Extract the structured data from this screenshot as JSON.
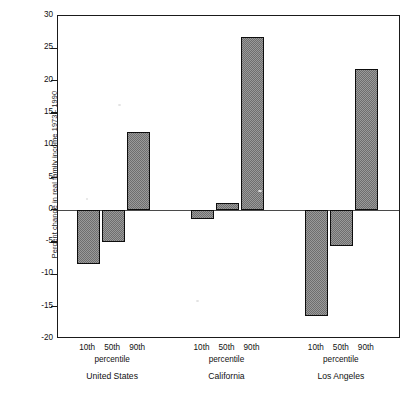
{
  "chart_data": {
    "type": "bar",
    "title": "",
    "xlabel": "",
    "ylabel": "Percent change in real family income 1973 - 1990",
    "ylim": [
      -20,
      30
    ],
    "yticks": [
      30,
      25,
      20,
      15,
      10,
      5,
      0,
      -5,
      -10,
      -15,
      -20
    ],
    "ytick_labels": [
      "30",
      "25",
      "20",
      "15",
      "10",
      "5",
      "0",
      "-5",
      "-10",
      "-15",
      "-20"
    ],
    "grid": false,
    "legend": null,
    "zero_reference_line": true,
    "categories": [
      "10th",
      "50th",
      "90th"
    ],
    "category_axis_label": "percentile",
    "groups": [
      {
        "name": "United States",
        "sub_label": "percentile",
        "bars": [
          {
            "category": "10th",
            "value": -8.4
          },
          {
            "category": "50th",
            "value": -5.0
          },
          {
            "category": "90th",
            "value": 12.0
          }
        ]
      },
      {
        "name": "California",
        "sub_label": "percentile",
        "bars": [
          {
            "category": "10th",
            "value": -1.5
          },
          {
            "category": "50th",
            "value": 1.0
          },
          {
            "category": "90th",
            "value": 26.7
          }
        ]
      },
      {
        "name": "Los Angeles",
        "sub_label": "percentile",
        "bars": [
          {
            "category": "10th",
            "value": -16.4
          },
          {
            "category": "50th",
            "value": -5.6
          },
          {
            "category": "90th",
            "value": 21.8
          }
        ]
      }
    ],
    "colors": {
      "bar_fill": "#9a9a9a",
      "bar_edge": "#0d0d0d",
      "axis": "#1a1a1a",
      "text": "#111111",
      "background": "#ffffff"
    }
  },
  "footer": {
    "text": ""
  }
}
